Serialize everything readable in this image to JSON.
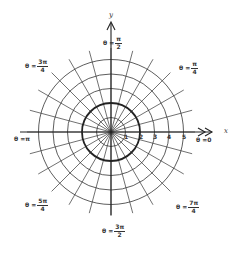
{
  "diagram": {
    "type": "polar-coordinate-grid",
    "center": {
      "x": 111,
      "y": 132
    },
    "ring_spacing_px": 14.5,
    "rings": [
      1,
      2,
      3,
      4,
      5
    ],
    "highlighted_ring": 2,
    "radial_step_fraction_of_pi": 12,
    "radial_line_length_px": 84,
    "colors": {
      "line": "#333333",
      "background": "#ffffff"
    },
    "axes": {
      "x": {
        "label": "x",
        "tick_labels": [
          "1",
          "2",
          "3",
          "4",
          "5"
        ]
      },
      "y": {
        "label": "y"
      }
    },
    "angle_labels": {
      "zero": {
        "prefix": "θ = ",
        "value": "0"
      },
      "pi_over_4": {
        "prefix": "θ = ",
        "num": "π",
        "den": "4"
      },
      "pi_over_2": {
        "prefix": "θ = ",
        "num": "π",
        "den": "2"
      },
      "three_pi_over_4": {
        "prefix": "θ = ",
        "num": "3π",
        "den": "4"
      },
      "pi": {
        "prefix": "θ = ",
        "value": "π"
      },
      "five_pi_over_4": {
        "prefix": "θ = ",
        "num": "5π",
        "den": "4"
      },
      "three_pi_over_2": {
        "prefix": "θ = ",
        "num": "3π",
        "den": "2"
      },
      "seven_pi_over_4": {
        "prefix": "θ = ",
        "num": "7π",
        "den": "4"
      }
    }
  }
}
